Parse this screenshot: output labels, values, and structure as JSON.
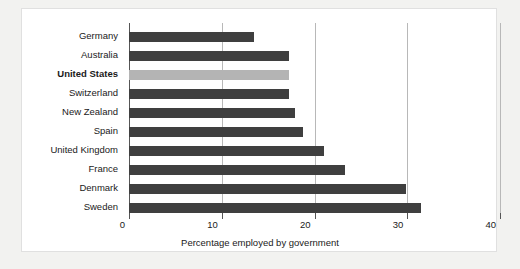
{
  "chart_data": {
    "type": "bar",
    "orientation": "horizontal",
    "title": "",
    "xlabel": "Percentage employed by government",
    "ylabel": "",
    "xlim": [
      0,
      40
    ],
    "xticks": [
      0,
      10,
      20,
      30,
      40
    ],
    "xtick_labels": [
      "0",
      "10",
      "20",
      "30",
      "40"
    ],
    "grid": "vertical",
    "legend": "none",
    "categories": [
      "Germany",
      "Australia",
      "United States",
      "Switzerland",
      "New Zealand",
      "Spain",
      "United Kingdom",
      "France",
      "Denmark",
      "Sweden"
    ],
    "values": [
      13.5,
      17.3,
      17.3,
      17.3,
      17.9,
      18.8,
      21.0,
      23.3,
      29.9,
      31.5
    ],
    "highlight_category": "United States",
    "colors": {
      "bar": "#3f3f3f",
      "bar_highlight": "#b4b4b4",
      "gridline": "#b8b8b8",
      "axis": "#555555",
      "panel_background": "#ffffff",
      "figure_background": "#f2f2f0",
      "text": "#1a1a1a"
    },
    "bold_categories": [
      "United States"
    ]
  }
}
